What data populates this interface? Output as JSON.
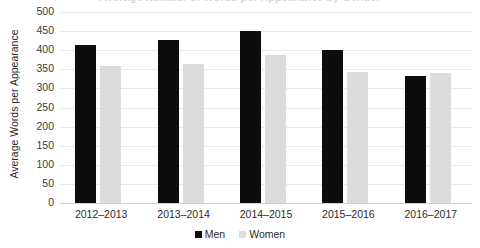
{
  "chart_data": {
    "type": "bar",
    "title": "Average Number of Words per Appearance by Gender",
    "xlabel": "",
    "ylabel": "Average Words per Appearance",
    "categories": [
      "2012–2013",
      "2013–2014",
      "2014–2015",
      "2015–2016",
      "2016–2017"
    ],
    "series": [
      {
        "name": "Men",
        "color": "#0d0d0d",
        "values": [
          414,
          428,
          450,
          400,
          332
        ]
      },
      {
        "name": "Women",
        "color": "#dcdcdc",
        "values": [
          359,
          364,
          387,
          343,
          340
        ]
      }
    ],
    "ylim": [
      0,
      500
    ],
    "ytick_values": [
      0,
      50,
      100,
      150,
      200,
      250,
      300,
      350,
      400,
      450,
      500
    ],
    "ytick_labels": [
      "0",
      "50",
      "100",
      "150",
      "200",
      "250",
      "300",
      "350",
      "400",
      "450",
      "500"
    ],
    "grid": true,
    "legend_position": "bottom"
  }
}
